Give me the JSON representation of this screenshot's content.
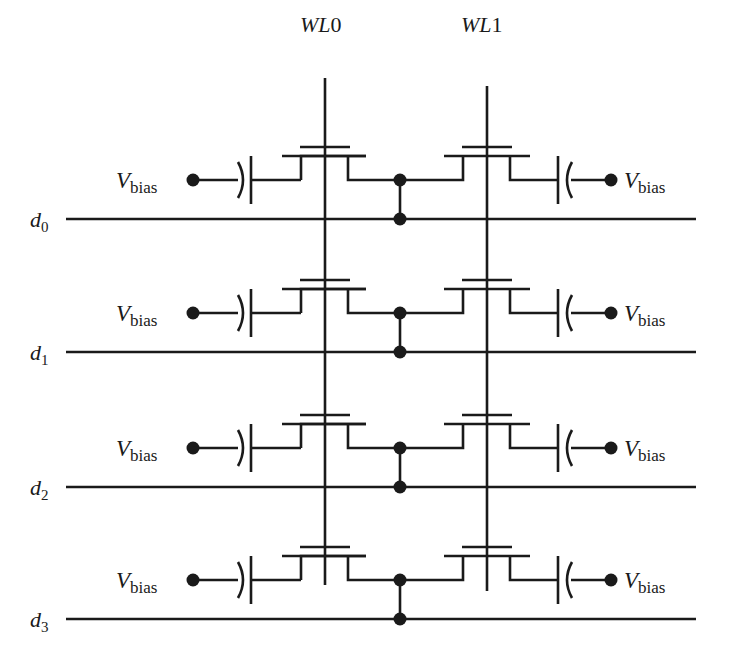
{
  "diagram": {
    "type": "circuit-schematic",
    "title": "",
    "colors": {
      "ink": "#1a1a1a",
      "background": "#ffffff"
    },
    "word_lines": [
      {
        "label_main": "WL",
        "label_index": "0",
        "x": 325,
        "y_top": 78,
        "y_bottom": 585
      },
      {
        "label_main": "WL",
        "label_index": "1",
        "x": 487,
        "y_top": 86,
        "y_bottom": 591
      }
    ],
    "bit_lines": [
      {
        "label_main": "d",
        "label_sub": "0",
        "y": 219
      },
      {
        "label_main": "d",
        "label_sub": "1",
        "y": 352
      },
      {
        "label_main": "d",
        "label_sub": "2",
        "y": 487
      },
      {
        "label_main": "d",
        "label_sub": "3",
        "y": 619
      }
    ],
    "bias_label": {
      "main": "V",
      "sub": "bias"
    },
    "rows": [
      {
        "bit_line": "d0",
        "left_bias": "Vbias",
        "right_bias": "Vbias"
      },
      {
        "bit_line": "d1",
        "left_bias": "Vbias",
        "right_bias": "Vbias"
      },
      {
        "bit_line": "d2",
        "left_bias": "Vbias",
        "right_bias": "Vbias"
      },
      {
        "bit_line": "d3",
        "left_bias": "Vbias",
        "right_bias": "Vbias"
      }
    ],
    "components_per_row": [
      "capacitor-left",
      "transistor-WL0",
      "junction",
      "transistor-WL1",
      "capacitor-right"
    ]
  }
}
